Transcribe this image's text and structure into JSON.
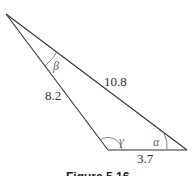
{
  "diagram": {
    "type": "triangle",
    "sides": {
      "left": "8.2",
      "hypotenuse": "10.8",
      "bottom": "3.7"
    },
    "angles": {
      "top": "β",
      "bottom_left": "γ",
      "bottom_right": "α"
    },
    "caption": "Figure 5.16"
  }
}
